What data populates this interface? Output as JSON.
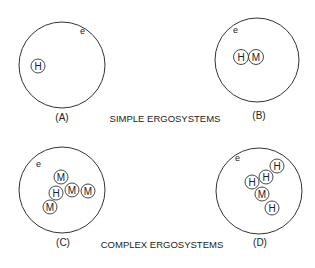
{
  "captions": {
    "simple": "SIMPLE ERGOSYSTEMS",
    "complex": "COMPLEX ERGOSYSTEMS"
  },
  "panels": [
    {
      "id": "A",
      "label": "(A)",
      "environment_label": "e",
      "nodes": [
        {
          "label": "H"
        }
      ]
    },
    {
      "id": "B",
      "label": "(B)",
      "environment_label": "e",
      "nodes": [
        {
          "label": "H"
        },
        {
          "label": "M"
        }
      ]
    },
    {
      "id": "C",
      "label": "(C)",
      "environment_label": "e",
      "nodes": [
        {
          "label": "M"
        },
        {
          "label": "H"
        },
        {
          "label": "M"
        },
        {
          "label": "M"
        },
        {
          "label": "M"
        }
      ]
    },
    {
      "id": "D",
      "label": "(D)",
      "environment_label": "e",
      "nodes": [
        {
          "label": "H"
        },
        {
          "label": "H"
        },
        {
          "label": "H"
        },
        {
          "label": "M"
        },
        {
          "label": "H"
        }
      ]
    }
  ],
  "colors": {
    "stroke": "#333333",
    "text": "#222222",
    "background": "#ffffff"
  }
}
